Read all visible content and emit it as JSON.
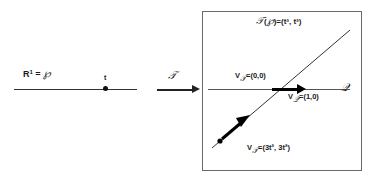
{
  "diagram": {
    "title_present": false,
    "domain_side": {
      "axis_label": "R",
      "axis_label_exponent": "1",
      "axis_label_equals": "=",
      "space_symbol": "℘",
      "point_label": "t",
      "line_name": "real-line"
    },
    "map_arrow": {
      "label": "𝒯",
      "direction": "right"
    },
    "target_side": {
      "axis_label": "𝒬",
      "image_label": "𝒯(℘) = (t³, t³)",
      "image_label_parts": {
        "map": "𝒯",
        "open": "(",
        "space": "℘",
        "close": ")",
        "equals": "=",
        "coords": "(t³, t³)"
      },
      "vectors": [
        {
          "name": "velocity-of-T-at-origin",
          "symbol": "V",
          "subscript": "𝒯",
          "equals": "=",
          "value": "(0,0)"
        },
        {
          "name": "velocity-of-Q",
          "symbol": "V",
          "subscript": "𝒬",
          "equals": "=",
          "value": "(1,0)"
        },
        {
          "name": "velocity-of-T-general",
          "symbol": "V",
          "subscript": "𝒯",
          "equals": "=",
          "value": "(3t², 3t²)"
        }
      ]
    },
    "colors": {
      "ink": "#1a1a1a",
      "line": "#555555",
      "box_border": "#6a6a6a",
      "arrow_fill": "#000000"
    }
  }
}
